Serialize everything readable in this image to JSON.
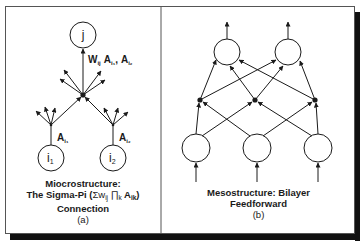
{
  "figure": {
    "panel_a": {
      "nodes": {
        "output": "j",
        "input_1_main": "i",
        "input_1_sub": "1",
        "input_2_main": "i",
        "input_2_sub": "2"
      },
      "weight_label": {
        "w": "W",
        "w_sub": "ij",
        "a1": "A",
        "a1_sub": "i₁",
        "sep": ",",
        "a2": "A",
        "a2_sub": "i₂"
      },
      "branch_labels": {
        "left": "A",
        "left_sub": "i₁",
        "right": "A",
        "right_sub": "i₂"
      },
      "caption": {
        "line1": "Miocrostructure:",
        "line2_prefix": "The Sigma-Pi (",
        "line2_formula": "Σw",
        "line2_sub1": "ij",
        "line2_prod": " ∏",
        "line2_sub2": "k",
        "line2_a": " A",
        "line2_sub3": "ik",
        "line2_suffix": ")",
        "line3": "Connection",
        "line4": "(a)"
      }
    },
    "panel_b": {
      "caption": {
        "line1": "Mesostructure:  Bilayer",
        "line2": "Feedforward",
        "line3": "(b)"
      },
      "layers": {
        "output_units": 2,
        "hidden_junctions": 3,
        "input_units": 3
      }
    },
    "colors": {
      "ink": "#1a1a1a",
      "border": "#555555",
      "shadow": "#111111",
      "background": "#ffffff"
    }
  }
}
